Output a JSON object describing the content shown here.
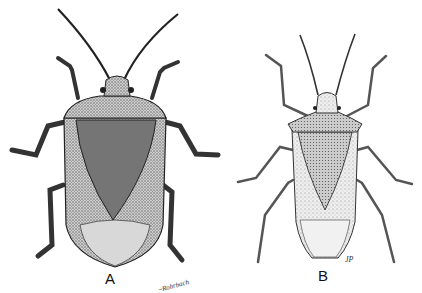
{
  "figure": {
    "panels": [
      {
        "id": "A",
        "label": "A",
        "subject": "stink bug dorsal view (stippled, dark)",
        "signature": "~Rohrbach"
      },
      {
        "id": "B",
        "label": "B",
        "subject": "stink bug dorsal view (lighter, spiny shoulders)",
        "signature": "JP"
      }
    ]
  },
  "colors": {
    "background": "#ffffff",
    "ink": "#111111",
    "stipple_dark": "#4a4a4a",
    "stipple_light": "#bdbdbd"
  }
}
